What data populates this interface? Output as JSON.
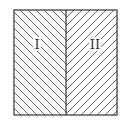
{
  "diagram": {
    "type": "hatched-square-two-regions",
    "colors": {
      "stroke": "#333333",
      "hatch": "#555555",
      "background": "#ffffff"
    },
    "regions": [
      {
        "id": "region-1",
        "label": "I",
        "hatch_direction": "down-right"
      },
      {
        "id": "region-2",
        "label": "II",
        "hatch_direction": "up-right"
      }
    ]
  }
}
